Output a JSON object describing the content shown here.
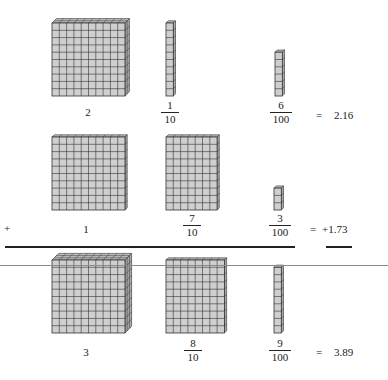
{
  "figure": {
    "colors": {
      "block_fill": "#cfcfcf",
      "block_top": "#bdbdbd",
      "block_side": "#a9a9a9",
      "grid_line": "#333333",
      "rule_gray": "#8a8a8a"
    },
    "rows": [
      {
        "ones": {
          "label": "2",
          "flats": 2
        },
        "tenths": {
          "numerator": "1",
          "denominator": "10",
          "rods": 1
        },
        "hundredths": {
          "numerator": "6",
          "denominator": "100",
          "units": 6
        },
        "equals": "=",
        "value": "2.16"
      },
      {
        "operator": "+",
        "ones": {
          "label": "1",
          "flats": 1
        },
        "tenths": {
          "numerator": "7",
          "denominator": "10",
          "rods": 7
        },
        "hundredths": {
          "numerator": "3",
          "denominator": "100",
          "units": 3
        },
        "equals": "=",
        "value": "+1.73"
      },
      {
        "ones": {
          "label": "3",
          "flats": 3
        },
        "tenths": {
          "numerator": "8",
          "denominator": "10",
          "rods": 8
        },
        "hundredths": {
          "numerator": "9",
          "denominator": "100",
          "units": 9
        },
        "equals": "=",
        "value": "3.89"
      }
    ]
  }
}
